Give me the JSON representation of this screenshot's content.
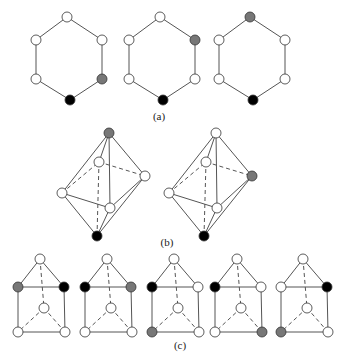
{
  "colors": {
    "line": "#555555",
    "white": "#ffffff",
    "gray": "#777777",
    "black": "#000000"
  },
  "captions": {
    "a": "(a)",
    "b": "(b)",
    "c": "(c)"
  },
  "hexagons": [
    {
      "cx": 69,
      "fills": [
        "white",
        "white",
        "gray",
        "black",
        "white",
        "white"
      ]
    },
    {
      "cx": 162,
      "fills": [
        "white",
        "gray",
        "white",
        "black",
        "white",
        "white"
      ]
    },
    {
      "cx": 252,
      "fills": [
        "gray",
        "white",
        "white",
        "black",
        "white",
        "white"
      ]
    }
  ],
  "octahedra": [
    {
      "dx": 0,
      "fills": {
        "top": "gray",
        "back": "white",
        "right": "white",
        "left": "white",
        "front": "white",
        "bottom": "black"
      }
    },
    {
      "dx": 107,
      "fills": {
        "top": "white",
        "back": "white",
        "right": "gray",
        "left": "white",
        "front": "white",
        "bottom": "black"
      }
    }
  ],
  "prisms": [
    {
      "dx": 0,
      "fills": {
        "top": "white",
        "left": "gray",
        "right": "black",
        "mid": "white",
        "bl": "white",
        "br": "white"
      }
    },
    {
      "dx": 67,
      "fills": {
        "top": "white",
        "left": "black",
        "right": "gray",
        "mid": "white",
        "bl": "white",
        "br": "white"
      }
    },
    {
      "dx": 134,
      "fills": {
        "top": "white",
        "left": "black",
        "right": "white",
        "mid": "white",
        "bl": "gray",
        "br": "white"
      }
    },
    {
      "dx": 197,
      "fills": {
        "top": "white",
        "left": "black",
        "right": "white",
        "mid": "white",
        "bl": "white",
        "br": "gray"
      }
    },
    {
      "dx": 263,
      "fills": {
        "top": "white",
        "left": "white",
        "right": "black",
        "mid": "white",
        "bl": "gray",
        "br": "white"
      }
    }
  ]
}
